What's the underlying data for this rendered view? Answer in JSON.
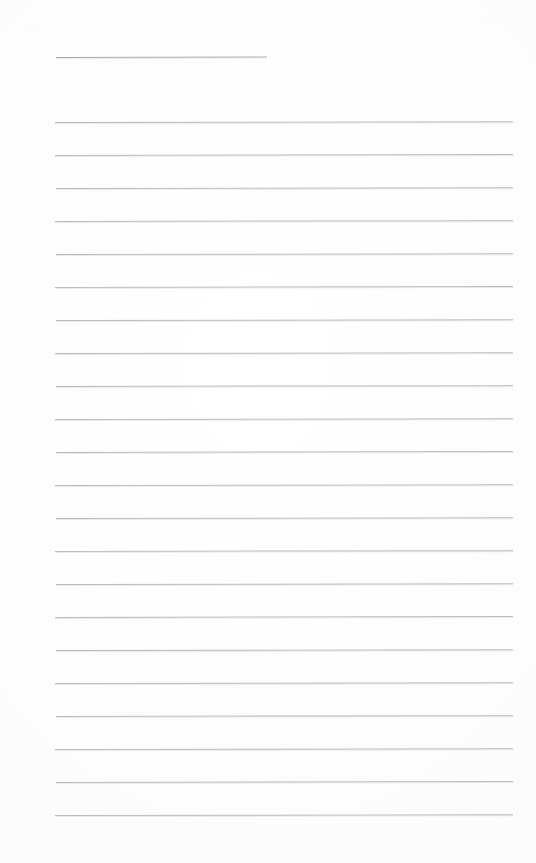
{
  "document": {
    "kind": "scanned-lined-paper",
    "title": "",
    "page_width": 536,
    "page_height": 863,
    "content_text": "",
    "is_blank": "true",
    "handwriting_present": "false"
  },
  "appearance": {
    "paper_color": "#fdfdfc",
    "paper_highlight_color": "#ffffff",
    "paper_edge_color": "#f8f8f7",
    "rule_color": "#b9bdc1",
    "header_rule_color": "#a9adb2",
    "rule_thickness_px": 1
  },
  "layout": {
    "left_margin_px": 55,
    "right_margin_px": 513,
    "header_rule_left_px": 56,
    "header_rule_right_px": 267,
    "header_rule_y_px": 57,
    "first_body_rule_y_px": 122,
    "last_body_rule_y_px": 815,
    "rule_spacing_px": 33,
    "body_rule_count": 22,
    "footer_blank_height_px": 48
  },
  "header_rule": {
    "name": "title-underline",
    "y": 57,
    "x": 56,
    "width": 211,
    "slant_deg": -0.12
  },
  "body_rules": [
    {
      "index": 1,
      "y": 122,
      "x": 55,
      "width": 458,
      "slant_deg": -0.1
    },
    {
      "index": 2,
      "y": 155,
      "x": 55,
      "width": 458,
      "slant_deg": -0.12
    },
    {
      "index": 3,
      "y": 188,
      "x": 56,
      "width": 457,
      "slant_deg": -0.08
    },
    {
      "index": 4,
      "y": 221,
      "x": 55,
      "width": 458,
      "slant_deg": -0.11
    },
    {
      "index": 5,
      "y": 254,
      "x": 56,
      "width": 457,
      "slant_deg": -0.09
    },
    {
      "index": 6,
      "y": 287,
      "x": 55,
      "width": 458,
      "slant_deg": -0.12
    },
    {
      "index": 7,
      "y": 320,
      "x": 56,
      "width": 457,
      "slant_deg": -0.1
    },
    {
      "index": 8,
      "y": 353,
      "x": 55,
      "width": 458,
      "slant_deg": -0.08
    },
    {
      "index": 9,
      "y": 386,
      "x": 56,
      "width": 457,
      "slant_deg": -0.11
    },
    {
      "index": 10,
      "y": 419,
      "x": 55,
      "width": 458,
      "slant_deg": -0.09
    },
    {
      "index": 11,
      "y": 452,
      "x": 56,
      "width": 457,
      "slant_deg": -0.12
    },
    {
      "index": 12,
      "y": 485,
      "x": 55,
      "width": 458,
      "slant_deg": -0.1
    },
    {
      "index": 13,
      "y": 518,
      "x": 56,
      "width": 457,
      "slant_deg": -0.08
    },
    {
      "index": 14,
      "y": 551,
      "x": 55,
      "width": 458,
      "slant_deg": -0.11
    },
    {
      "index": 15,
      "y": 584,
      "x": 56,
      "width": 457,
      "slant_deg": -0.09
    },
    {
      "index": 16,
      "y": 617,
      "x": 55,
      "width": 458,
      "slant_deg": -0.12
    },
    {
      "index": 17,
      "y": 650,
      "x": 56,
      "width": 457,
      "slant_deg": -0.1
    },
    {
      "index": 18,
      "y": 683,
      "x": 55,
      "width": 458,
      "slant_deg": -0.08
    },
    {
      "index": 19,
      "y": 716,
      "x": 56,
      "width": 457,
      "slant_deg": -0.11
    },
    {
      "index": 20,
      "y": 749,
      "x": 55,
      "width": 458,
      "slant_deg": -0.09
    },
    {
      "index": 21,
      "y": 782,
      "x": 56,
      "width": 457,
      "slant_deg": -0.12
    },
    {
      "index": 22,
      "y": 815,
      "x": 55,
      "width": 458,
      "slant_deg": -0.1
    }
  ]
}
